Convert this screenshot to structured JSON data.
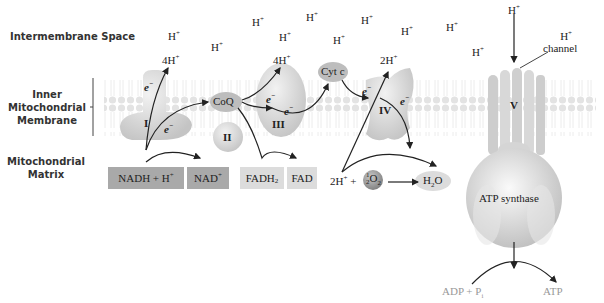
{
  "regions": {
    "intermembrane": "Intermembrane Space",
    "inner_membrane": [
      "Inner",
      "Mitochondrial",
      "Membrane"
    ],
    "matrix": [
      "Mitochondrial",
      "Matrix"
    ]
  },
  "protons": {
    "h_plus": "H",
    "h_plus_sup": "+",
    "four_h_1": "4H",
    "four_h_2": "4H",
    "two_h": "2H",
    "two_h_matrix": "2H"
  },
  "complexes": {
    "c1": "I",
    "c2": "II",
    "c3": "III",
    "c4": "IV",
    "c5": "V",
    "coq": "CoQ",
    "cytc": "Cyt c",
    "atp_synthase": "ATP synthase",
    "channel": "channel"
  },
  "electrons": {
    "e": "e",
    "sup": "−"
  },
  "matrix_boxes": {
    "nadh": "NADH + H",
    "nad": "NAD",
    "fadh2": "FADH",
    "fadh2_sub": "2",
    "fad": "FAD"
  },
  "reaction": {
    "half_num": "1",
    "half_den": "2",
    "o2": "O",
    "o2_sub": "2",
    "plus": "+",
    "arrow": "⟶",
    "h2o_h": "H",
    "h2o_sub": "2",
    "h2o_o": "O"
  },
  "atp_reaction": {
    "adp": "ADP + P",
    "adp_sub": "i",
    "atp": "ATP"
  },
  "colors": {
    "membrane": "#e6e6e6",
    "protein": "#cfcfcf",
    "nadh_box": "#a9a9a9",
    "fadh_box": "#dcdcdc",
    "text": "#222222",
    "atp_text": "#999999"
  }
}
